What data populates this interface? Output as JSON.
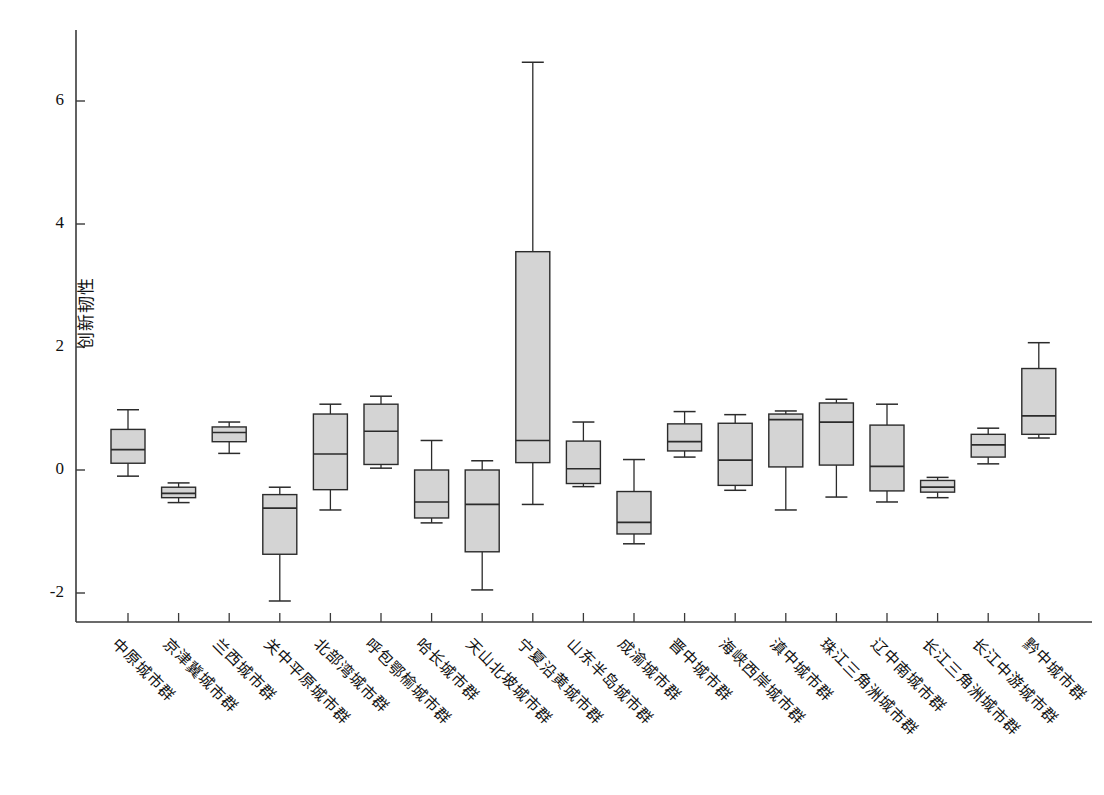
{
  "chart_data": {
    "type": "box",
    "title": "",
    "xlabel": "",
    "ylabel": "创新韧性",
    "ylim": [
      -2.75,
      7.0
    ],
    "yticks": [
      -2,
      0,
      2,
      4,
      6
    ],
    "ytick_labels": [
      "-2",
      "0",
      "2",
      "4",
      "6"
    ],
    "grid": false,
    "legend": "none",
    "box_fill": "#d4d4d4",
    "box_stroke": "#2b2b2b",
    "axis_color": "#3a3a3a",
    "categories": [
      "中原城市群",
      "京津冀城市群",
      "兰西城市群",
      "关中平原城市群",
      "北部湾城市群",
      "呼包鄂榆城市群",
      "哈长城市群",
      "天山北坡城市群",
      "宁夏沿黄城市群",
      "山东半岛城市群",
      "成渝城市群",
      "晋中城市群",
      "海峡西岸城市群",
      "滇中城市群",
      "珠江三角洲城市群",
      "辽中南城市群",
      "长江三角洲城市群",
      "长江中游城市群",
      "黔中城市群"
    ],
    "boxes": [
      {
        "category": "中原城市群",
        "whisker_low": -0.1,
        "q1": 0.11,
        "median": 0.33,
        "q3": 0.66,
        "whisker_high": 0.98
      },
      {
        "category": "京津冀城市群",
        "whisker_low": -0.53,
        "q1": -0.45,
        "median": -0.38,
        "q3": -0.28,
        "whisker_high": -0.21
      },
      {
        "category": "兰西城市群",
        "whisker_low": 0.27,
        "q1": 0.46,
        "median": 0.61,
        "q3": 0.7,
        "whisker_high": 0.78
      },
      {
        "category": "关中平原城市群",
        "whisker_low": -2.13,
        "q1": -1.37,
        "median": -0.62,
        "q3": -0.4,
        "whisker_high": -0.28
      },
      {
        "category": "北部湾城市群",
        "whisker_low": -0.65,
        "q1": -0.32,
        "median": 0.26,
        "q3": 0.91,
        "whisker_high": 1.07
      },
      {
        "category": "呼包鄂榆城市群",
        "whisker_low": 0.03,
        "q1": 0.09,
        "median": 0.63,
        "q3": 1.07,
        "whisker_high": 1.2
      },
      {
        "category": "哈长城市群",
        "whisker_low": -0.86,
        "q1": -0.78,
        "median": -0.52,
        "q3": 0.0,
        "whisker_high": 0.48
      },
      {
        "category": "天山北坡城市群",
        "whisker_low": -1.95,
        "q1": -1.33,
        "median": -0.56,
        "q3": 0.0,
        "whisker_high": 0.15
      },
      {
        "category": "宁夏沿黄城市群",
        "whisker_low": -0.56,
        "q1": 0.12,
        "median": 0.48,
        "q3": 3.55,
        "whisker_high": 6.63
      },
      {
        "category": "山东半岛城市群",
        "whisker_low": -0.27,
        "q1": -0.22,
        "median": 0.02,
        "q3": 0.47,
        "whisker_high": 0.78
      },
      {
        "category": "成渝城市群",
        "whisker_low": -1.2,
        "q1": -1.04,
        "median": -0.85,
        "q3": -0.35,
        "whisker_high": 0.17
      },
      {
        "category": "晋中城市群",
        "whisker_low": 0.21,
        "q1": 0.31,
        "median": 0.46,
        "q3": 0.75,
        "whisker_high": 0.95
      },
      {
        "category": "海峡西岸城市群",
        "whisker_low": -0.33,
        "q1": -0.25,
        "median": 0.16,
        "q3": 0.76,
        "whisker_high": 0.9
      },
      {
        "category": "滇中城市群",
        "whisker_low": -0.65,
        "q1": 0.05,
        "median": 0.82,
        "q3": 0.91,
        "whisker_high": 0.96
      },
      {
        "category": "珠江三角洲城市群",
        "whisker_low": -0.44,
        "q1": 0.08,
        "median": 0.78,
        "q3": 1.09,
        "whisker_high": 1.15
      },
      {
        "category": "辽中南城市群",
        "whisker_low": -0.52,
        "q1": -0.34,
        "median": 0.06,
        "q3": 0.73,
        "whisker_high": 1.07
      },
      {
        "category": "长江三角洲城市群",
        "whisker_low": -0.45,
        "q1": -0.36,
        "median": -0.28,
        "q3": -0.17,
        "whisker_high": -0.12
      },
      {
        "category": "长江中游城市群",
        "whisker_low": 0.1,
        "q1": 0.21,
        "median": 0.41,
        "q3": 0.58,
        "whisker_high": 0.68
      },
      {
        "category": "黔中城市群",
        "whisker_low": 0.52,
        "q1": 0.58,
        "median": 0.88,
        "q3": 1.65,
        "whisker_high": 2.07
      }
    ]
  }
}
